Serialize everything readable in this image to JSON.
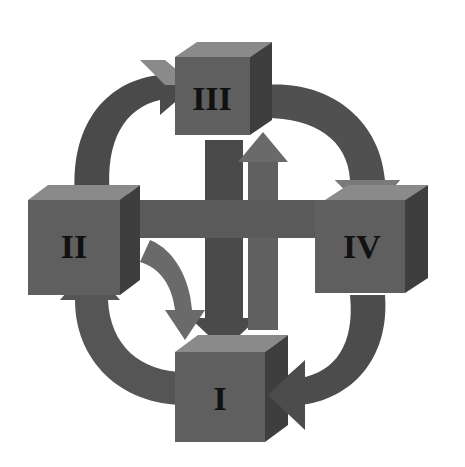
{
  "diagram": {
    "type": "cycle",
    "nodes": [
      {
        "id": "I",
        "label": "I",
        "position": "bottom"
      },
      {
        "id": "II",
        "label": "II",
        "position": "left"
      },
      {
        "id": "III",
        "label": "III",
        "position": "top"
      },
      {
        "id": "IV",
        "label": "IV",
        "position": "right"
      }
    ],
    "edges": [
      {
        "from": "I",
        "to": "II",
        "style": "curved-arrow"
      },
      {
        "from": "II",
        "to": "III",
        "style": "curved-arrow"
      },
      {
        "from": "III",
        "to": "IV",
        "style": "curved-arrow"
      },
      {
        "from": "IV",
        "to": "I",
        "style": "curved-arrow"
      },
      {
        "from": "III",
        "to": "I",
        "style": "straight-arrow"
      },
      {
        "from": "I",
        "to": "III",
        "style": "straight-arrow"
      },
      {
        "from": "IV",
        "to": "II",
        "style": "straight-arrow"
      },
      {
        "from": "II",
        "to": "I",
        "style": "curved-arrow"
      }
    ],
    "colors": {
      "face": "#5f5f5f",
      "top": "#8a8a8a",
      "side": "#3e3e3e",
      "arrow": "#555555",
      "arrow_light": "#7a7a7a",
      "text": "#111111"
    }
  }
}
